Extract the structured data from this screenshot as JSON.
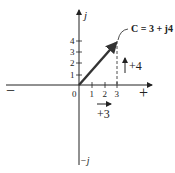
{
  "diagram": {
    "type": "complex-plane-phasor",
    "axes": {
      "real_negative_label": "−",
      "real_positive_label": "+",
      "imag_positive_label": "j",
      "imag_negative_label": "−j",
      "origin_label": "0"
    },
    "x_ticks": [
      "1",
      "2",
      "3"
    ],
    "y_ticks": [
      "1",
      "2",
      "3",
      "4"
    ],
    "phasor": {
      "label": "C = 3 + j4",
      "real": 3,
      "imag": 4
    },
    "components": {
      "horizontal_label": "+3",
      "vertical_label": "+4"
    },
    "colors": {
      "ink": "#222222",
      "phasor": "#333333",
      "background": "#ffffff"
    }
  }
}
